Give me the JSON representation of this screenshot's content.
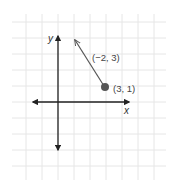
{
  "diagram": {
    "grid": {
      "color": "#e6e6e6",
      "spacing_px": 16
    },
    "axes": {
      "x_label": "x",
      "y_label": "y",
      "color": "#222222"
    },
    "point": {
      "label": "(3, 1)",
      "x": 3,
      "y": 1,
      "color": "#555555"
    },
    "vector": {
      "label": "(−2, 3)",
      "dx": -2,
      "dy": 3,
      "color": "#555555"
    }
  }
}
